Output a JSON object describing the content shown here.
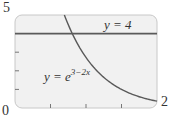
{
  "chart_data": {
    "type": "line",
    "title": "",
    "xlabel": "",
    "ylabel": "",
    "xlim": [
      0,
      2
    ],
    "ylim": [
      0,
      5
    ],
    "grid": false,
    "axis_labels": {
      "y_max": "5",
      "origin": "0",
      "x_max": "2"
    },
    "x_ticks": [
      0.5,
      1.0,
      1.5
    ],
    "y_ticks": [
      1,
      2,
      3,
      4
    ],
    "series": [
      {
        "name": "y = 4",
        "label_text": "y = 4",
        "type": "horizontal_line",
        "equation": "y = 4",
        "x": [
          0,
          2
        ],
        "y": [
          4,
          4
        ]
      },
      {
        "name": "y = e^(3-2x)",
        "label_base": "y = e",
        "label_exp": "3−2x",
        "type": "curve",
        "equation": "y = e^(3-2x)",
        "x": [
          0.695,
          0.75,
          0.888,
          1.0,
          1.25,
          1.5,
          1.75,
          2.0
        ],
        "y": [
          5.0,
          4.48,
          4.0,
          2.72,
          1.65,
          1.0,
          0.61,
          0.37
        ]
      }
    ]
  },
  "colors": {
    "frame_fill": "#f1f1f1",
    "frame_stroke": "#c8c8c8",
    "line": "#5a5a5a",
    "text": "#333333"
  }
}
